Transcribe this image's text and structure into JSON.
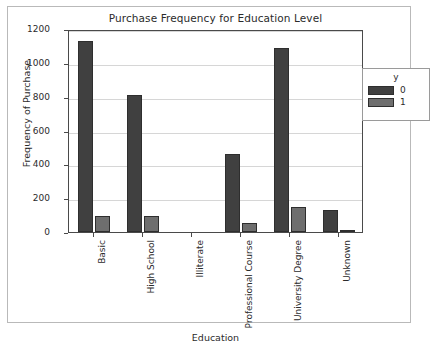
{
  "chart_data": {
    "type": "bar",
    "title": "Purchase Frequency for Education Level",
    "xlabel": "Education",
    "ylabel": "Frequency of Purchase",
    "categories": [
      "Basic",
      "High School",
      "Illiterate",
      "Professional Course",
      "University Degree",
      "Unknown"
    ],
    "series": [
      {
        "name": "0",
        "values": [
          1130,
          812,
          1,
          460,
          1089,
          128
        ],
        "color": "#404040"
      },
      {
        "name": "1",
        "values": [
          94,
          92,
          0,
          55,
          150,
          14
        ],
        "color": "#6e6e6e"
      }
    ],
    "legend_title": "y",
    "legend_position": "upper right",
    "ylim": [
      0,
      1200
    ],
    "yticks": [
      0,
      200,
      400,
      600,
      800,
      1000,
      1200
    ],
    "ytick_labels": [
      "0",
      "200",
      "400",
      "600",
      "800",
      "1000",
      "1200"
    ],
    "grid": true
  },
  "colors": {
    "series_0": "#404040",
    "series_1": "#6e6e6e",
    "axis": "#4a4a4a",
    "grid": "#d6d6d6",
    "frame": "#b9b9b9",
    "text": "#2b2b2b",
    "background": "#ffffff"
  }
}
